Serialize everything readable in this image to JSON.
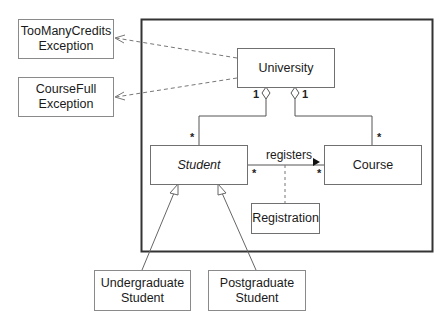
{
  "diagram": {
    "type": "UML class diagram",
    "frame": {
      "stroke": "#333333"
    },
    "classes": {
      "too_many_credits": {
        "label": "TooManyCredits\nException"
      },
      "course_full": {
        "label": "CourseFull\nException"
      },
      "university": {
        "label": "University"
      },
      "student": {
        "label": "Student",
        "abstract": true
      },
      "course": {
        "label": "Course"
      },
      "registration": {
        "label": "Registration"
      },
      "undergraduate": {
        "label": "Undergraduate\nStudent"
      },
      "postgraduate": {
        "label": "Postgraduate\nStudent"
      }
    },
    "relationships": {
      "aggregation_student": {
        "from": "University",
        "to": "Student",
        "source_mult": "1",
        "target_mult": "*"
      },
      "aggregation_course": {
        "from": "University",
        "to": "Course",
        "source_mult": "1",
        "target_mult": "*"
      },
      "association": {
        "label": "registers",
        "direction_glyph": "▶",
        "source_mult": "*",
        "target_mult": "*"
      },
      "association_class": "Registration",
      "dependencies": [
        "University → TooManyCreditsException",
        "University → CourseFullException"
      ],
      "generalizations": [
        "UndergraduateStudent → Student",
        "PostgraduateStudent → Student"
      ]
    }
  }
}
